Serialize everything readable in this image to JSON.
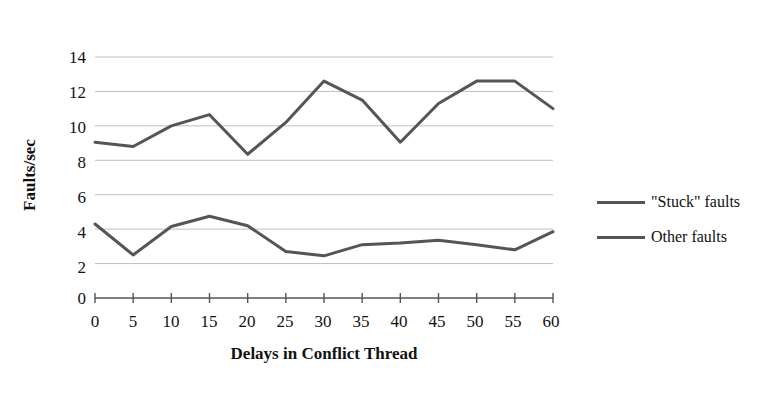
{
  "chart_data": {
    "type": "line",
    "title": "",
    "xlabel": "Delays in Conflict Thread",
    "ylabel": "Faults/sec",
    "x": [
      0,
      5,
      10,
      15,
      20,
      25,
      30,
      35,
      40,
      45,
      50,
      55,
      60
    ],
    "xticklabels": [
      "0",
      "5",
      "10",
      "15",
      "20",
      "25",
      "30",
      "35",
      "40",
      "45",
      "50",
      "55",
      "60"
    ],
    "yticklabels": [
      "0",
      "2",
      "4",
      "6",
      "8",
      "10",
      "12",
      "14"
    ],
    "yticks": [
      0,
      2,
      4,
      6,
      8,
      10,
      12,
      14
    ],
    "xlim": [
      0,
      60
    ],
    "ylim": [
      0,
      14
    ],
    "grid": "horizontal",
    "legend_position": "right",
    "series": [
      {
        "name": "\"Stuck\" faults",
        "color": "#555555",
        "values": [
          4.3,
          2.5,
          4.15,
          4.75,
          4.2,
          2.7,
          2.45,
          3.1,
          3.2,
          3.35,
          3.1,
          2.8,
          3.85
        ]
      },
      {
        "name": "Other faults",
        "color": "#555555",
        "values": [
          9.05,
          8.8,
          10.0,
          10.65,
          8.35,
          10.2,
          12.6,
          11.5,
          9.05,
          11.3,
          12.6,
          12.6,
          11.0
        ]
      }
    ]
  },
  "legend": {
    "entries": [
      {
        "label": "\"Stuck\" faults"
      },
      {
        "label": "Other faults"
      }
    ]
  },
  "axes": {
    "y_axis_title": "Faults/sec",
    "x_axis_title": "Delays in Conflict Thread"
  },
  "colors": {
    "line": "#555555",
    "grid": "#bfbfbf",
    "axis": "#555555",
    "text": "#111111",
    "background": "#ffffff"
  }
}
